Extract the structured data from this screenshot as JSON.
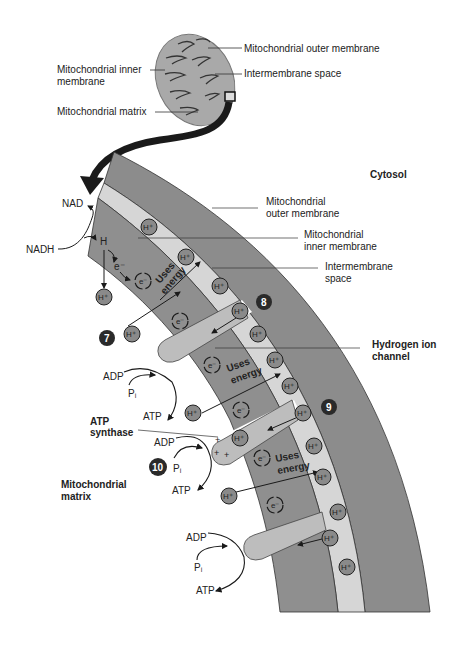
{
  "colors": {
    "outer_membrane": "#8c8c8c",
    "intermembrane_space": "#d6d6d6",
    "inner_membrane": "#8f8f8f",
    "channel": "#bdbdbd",
    "ion_fill": "#8a8a8a",
    "step_badge": "#2a2a2a",
    "arrow": "#1a1a1a",
    "mitochondrion_fill": "#a9a9a9"
  },
  "mitochondrion_labels": {
    "outer_membrane": "Mitochondrial outer membrane",
    "inner_membrane_line1": "Mitochondrial inner",
    "inner_membrane_line2": "membrane",
    "intermembrane_space": "Intermembrane space",
    "matrix": "Mitochondrial matrix"
  },
  "detail_labels": {
    "cytosol": "Cytosol",
    "outer_membrane_line1": "Mitochondrial",
    "outer_membrane_line2": "outer membrane",
    "inner_membrane_line1": "Mitochondrial",
    "inner_membrane_line2": "inner membrane",
    "intermembrane_line1": "Intermembrane",
    "intermembrane_line2": "space",
    "hydrogen_channel_line1": "Hydrogen ion",
    "hydrogen_channel_line2": "channel",
    "atp_synthase_line1": "ATP",
    "atp_synthase_line2": "synthase",
    "matrix_line1": "Mitochondrial",
    "matrix_line2": "matrix"
  },
  "molecules": {
    "nad": "NAD",
    "nadh": "NADH",
    "h": "H",
    "electron": "e⁻",
    "hydrogen_ion": "H⁺",
    "adp": "ADP",
    "pi": "Pᵢ",
    "atp": "ATP",
    "uses_energy_line1": "Uses",
    "uses_energy_line2": "energy"
  },
  "steps": [
    "7",
    "8",
    "9",
    "10"
  ]
}
